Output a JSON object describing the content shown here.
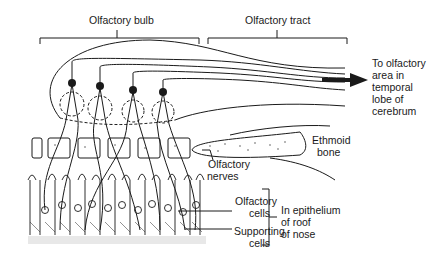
{
  "diagram": {
    "type": "anatomical-illustration",
    "labels": {
      "olfactory_bulb": "Olfactory bulb",
      "olfactory_tract": "Olfactory tract",
      "destination_line1": "To olfactory",
      "destination_line2": "area in",
      "destination_line3": "temporal",
      "destination_line4": "lobe of",
      "destination_line5": "cerebrum",
      "ethmoid_line1": "Ethmoid",
      "ethmoid_line2": "bone",
      "nerves_line1": "Olfactory",
      "nerves_line2": "nerves",
      "olfactory_cells_line1": "Olfactory",
      "olfactory_cells_line2": "cells",
      "supporting_cells_line1": "Supporting",
      "supporting_cells_line2": "cells",
      "epithelium_line1": "In epithelium",
      "epithelium_line2": "of roof",
      "epithelium_line3": "of nose"
    },
    "colors": {
      "ink": "#1a1a1a",
      "background": "#ffffff"
    }
  }
}
